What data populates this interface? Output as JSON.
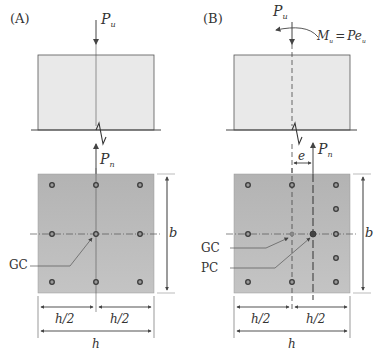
{
  "panels": [
    {
      "id": "A",
      "label": "(A)",
      "load_top": {
        "symbol": "P",
        "subscript": "u"
      },
      "load_bottom": {
        "symbol": "P",
        "subscript": "n"
      },
      "section_labels": {
        "gc": "GC"
      },
      "dimensions": {
        "half_left": "h/2",
        "half_right": "h/2",
        "width": "h",
        "depth": "b"
      },
      "bars": 8
    },
    {
      "id": "B",
      "label": "(B)",
      "load_top": {
        "symbol": "P",
        "subscript": "u"
      },
      "moment": {
        "symbol": "M",
        "subscript": "u",
        "equals": "=",
        "rhs": "Pe",
        "rhs_subscript": "u"
      },
      "load_bottom": {
        "symbol": "P",
        "subscript": "n"
      },
      "eccentricity": "e",
      "section_labels": {
        "gc": "GC",
        "pc": "PC"
      },
      "dimensions": {
        "half_left": "h/2",
        "half_right": "h/2",
        "width": "h",
        "depth": "b"
      },
      "bars": 11
    }
  ],
  "colors": {
    "block_fill": "#e9e9e9",
    "section_fill": "#b9b9b9",
    "line": "#555555",
    "bar": "#444444"
  }
}
